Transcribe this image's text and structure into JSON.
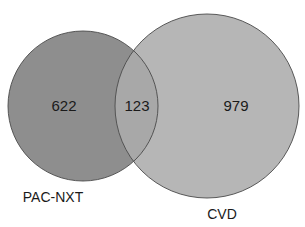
{
  "diagram": {
    "type": "venn",
    "sets": [
      {
        "name": "PAC-NXT",
        "only_count": "622",
        "color": "#8e8e8e"
      },
      {
        "name": "CVD",
        "only_count": "979",
        "color": "#b6b6b6"
      }
    ],
    "intersection": {
      "count": "123",
      "color": "#a8a8a8"
    },
    "outline_color": "#4a4a4a"
  }
}
